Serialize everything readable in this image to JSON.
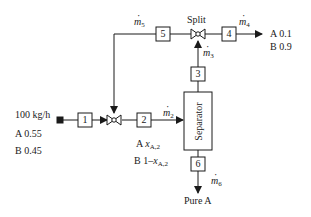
{
  "feed": {
    "flow": "100 kg/h",
    "comp_a": "A 0.55",
    "comp_b": "B 0.45"
  },
  "streams": {
    "s1": "1",
    "s2": "2",
    "s3": "3",
    "s4": "4",
    "s5": "5",
    "s6": "6"
  },
  "flow_labels": {
    "m2": "m",
    "m2_sub": "2",
    "m3": "m",
    "m3_sub": "3",
    "m4": "m",
    "m4_sub": "4",
    "m5": "m",
    "m5_sub": "5",
    "m6": "m",
    "m6_sub": "6"
  },
  "stream2_comp": {
    "a_prefix": "A ",
    "a_var": "x",
    "a_sub": "A,2",
    "b_prefix": "B 1–",
    "b_var": "x",
    "b_sub": "A,2"
  },
  "split_label": "Split",
  "separator_label": "Separator",
  "product4": {
    "comp_a": "A 0.1",
    "comp_b": "B 0.9"
  },
  "product6": "Pure A"
}
